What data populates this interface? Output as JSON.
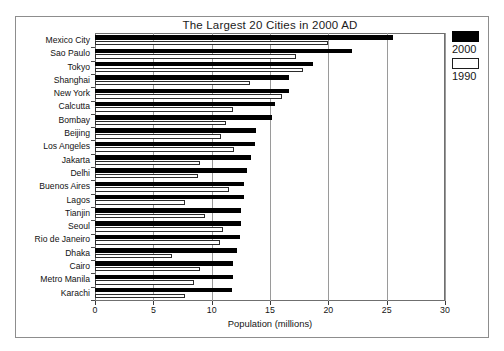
{
  "chart_data": {
    "type": "bar",
    "orientation": "horizontal",
    "title": "The Largest 20 Cities in 2000 AD",
    "xlabel": "Population (millions)",
    "ylabel": "",
    "xlim": [
      0,
      30
    ],
    "xticks": [
      0,
      5,
      10,
      15,
      20,
      25,
      30
    ],
    "grid": true,
    "legend_position": "right",
    "categories": [
      "Mexico City",
      "Sao Paulo",
      "Tokyo",
      "Shanghai",
      "New York",
      "Calcutta",
      "Bombay",
      "Beijing",
      "Los Angeles",
      "Jakarta",
      "Delhi",
      "Buenos Aires",
      "Lagos",
      "Tianjin",
      "Seoul",
      "Rio de Janeiro",
      "Dhaka",
      "Cairo",
      "Metro Manila",
      "Karachi"
    ],
    "series": [
      {
        "name": "2000",
        "color": "#000000",
        "values": [
          25.5,
          22.0,
          18.7,
          16.6,
          16.6,
          15.4,
          15.2,
          13.8,
          13.7,
          13.4,
          13.0,
          12.8,
          12.8,
          12.5,
          12.5,
          12.4,
          12.2,
          11.8,
          11.8,
          11.7
        ]
      },
      {
        "name": "1990",
        "color": "#ffffff",
        "values": [
          20.0,
          17.2,
          17.8,
          13.3,
          16.0,
          11.8,
          11.2,
          10.8,
          11.9,
          9.0,
          8.8,
          11.5,
          7.7,
          9.4,
          11.0,
          10.7,
          6.6,
          9.0,
          8.5,
          7.7
        ]
      }
    ]
  },
  "legend": {
    "entries": [
      {
        "label": "2000",
        "swatch": "filled-black-swatch"
      },
      {
        "label": "1990",
        "swatch": "outlined-white-swatch"
      }
    ]
  },
  "axis": {
    "x_tick_labels": [
      "0",
      "5",
      "10",
      "15",
      "20",
      "25",
      "30"
    ],
    "x_title": "Population (millions)"
  }
}
